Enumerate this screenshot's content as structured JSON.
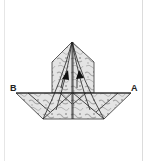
{
  "diagram": {
    "type": "origami-fold-step",
    "labels": {
      "left_corner": "B",
      "right_corner": "A"
    },
    "arrows": [
      {
        "name": "left-fold-arrow",
        "direction": "up"
      },
      {
        "name": "right-fold-arrow",
        "direction": "up"
      }
    ],
    "colors": {
      "line": "#222222",
      "paper_fill": "#d8d8d8",
      "paper_pattern": "#9a9a9a",
      "background": "#ffffff"
    }
  }
}
